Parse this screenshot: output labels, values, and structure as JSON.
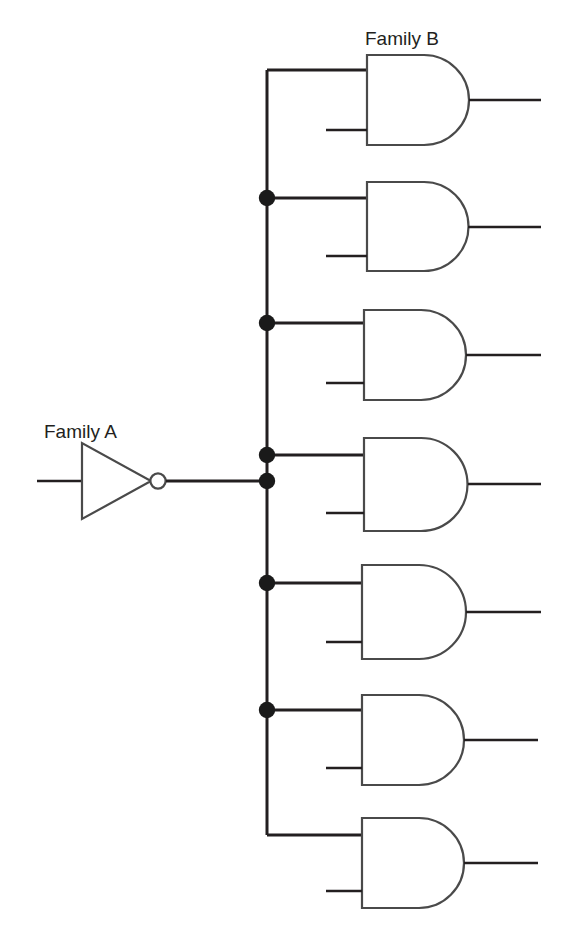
{
  "diagram": {
    "type": "digital-logic-schematic",
    "canvas": {
      "width": 569,
      "height": 935
    },
    "colors": {
      "background": "#ffffff",
      "wire": "#231f20",
      "gate_outline": "#4a4a4a",
      "junction_dot": "#1a1a1a",
      "label_text": "#231f20"
    },
    "labels": {
      "family_a": "Family A",
      "family_b": "Family B"
    },
    "label_positions": {
      "family_a": {
        "x": 44,
        "y": 438
      },
      "family_b": {
        "x": 365,
        "y": 45
      }
    },
    "driver": {
      "name": "inverter",
      "symbol": "NOT",
      "family": "Family A",
      "triangle": {
        "x1": 82,
        "y1": 443,
        "x2": 82,
        "y2": 519,
        "apex_x": 151,
        "apex_y": 481
      },
      "bubble": {
        "cx": 158,
        "cy": 481,
        "r": 8
      },
      "input_wire": {
        "x1": 37,
        "y1": 481,
        "x2": 82,
        "y2": 481
      },
      "output_wire": {
        "x1": 166,
        "y1": 481,
        "x2": 267,
        "y2": 481
      }
    },
    "bus": {
      "x": 267,
      "y_top": 70,
      "y_bottom": 835,
      "top_corner_to_gate_x": 367,
      "bottom_corner_to_gate_x": 362,
      "stroke_width": 3
    },
    "junction_dots": [
      {
        "y": 198,
        "r": 8
      },
      {
        "y": 323,
        "r": 8
      },
      {
        "y": 455,
        "r": 8
      },
      {
        "y": 481,
        "r": 8
      },
      {
        "y": 583,
        "r": 8
      },
      {
        "y": 710,
        "r": 8
      }
    ],
    "load_count": 7,
    "gates": [
      {
        "index": 1,
        "name": "and-gate-1",
        "symbol": "AND",
        "family": "Family B",
        "body": {
          "x": 367,
          "top": 55,
          "bottom": 145,
          "flat_right": 424,
          "arc_right": 478
        },
        "top_input": {
          "y": 70,
          "from_x": 267,
          "connector": "bus-top-corner",
          "has_dot": false
        },
        "bottom_input": {
          "y": 130,
          "from_x": 326
        },
        "output": {
          "y": 100,
          "to_x": 541
        }
      },
      {
        "index": 2,
        "name": "and-gate-2",
        "symbol": "AND",
        "family": "Family B",
        "body": {
          "x": 367,
          "top": 182,
          "bottom": 271,
          "flat_right": 424,
          "arc_right": 476
        },
        "top_input": {
          "y": 198,
          "from_x": 267,
          "connector": "bus-dot",
          "has_dot": true
        },
        "bottom_input": {
          "y": 256,
          "from_x": 326
        },
        "output": {
          "y": 227,
          "to_x": 541
        }
      },
      {
        "index": 3,
        "name": "and-gate-3",
        "symbol": "AND",
        "family": "Family B",
        "body": {
          "x": 364,
          "top": 310,
          "bottom": 400,
          "flat_right": 421,
          "arc_right": 473
        },
        "top_input": {
          "y": 323,
          "from_x": 267,
          "connector": "bus-dot",
          "has_dot": true
        },
        "bottom_input": {
          "y": 383,
          "from_x": 326
        },
        "output": {
          "y": 355,
          "to_x": 541
        }
      },
      {
        "index": 4,
        "name": "and-gate-4",
        "symbol": "AND",
        "family": "Family B",
        "body": {
          "x": 364,
          "top": 438,
          "bottom": 531,
          "flat_right": 421,
          "arc_right": 475
        },
        "top_input": {
          "y": 455,
          "from_x": 267,
          "connector": "bus-dot",
          "has_dot": true
        },
        "bottom_input": {
          "y": 513,
          "from_x": 326
        },
        "output": {
          "y": 484,
          "to_x": 541
        }
      },
      {
        "index": 5,
        "name": "and-gate-5",
        "symbol": "AND",
        "family": "Family B",
        "body": {
          "x": 362,
          "top": 565,
          "bottom": 659,
          "flat_right": 419,
          "arc_right": 472
        },
        "top_input": {
          "y": 583,
          "from_x": 267,
          "connector": "bus-dot",
          "has_dot": true
        },
        "bottom_input": {
          "y": 642,
          "from_x": 326
        },
        "output": {
          "y": 612,
          "to_x": 541
        }
      },
      {
        "index": 6,
        "name": "and-gate-6",
        "symbol": "AND",
        "family": "Family B",
        "body": {
          "x": 362,
          "top": 695,
          "bottom": 785,
          "flat_right": 419,
          "arc_right": 470
        },
        "top_input": {
          "y": 710,
          "from_x": 267,
          "connector": "bus-dot",
          "has_dot": true
        },
        "bottom_input": {
          "y": 768,
          "from_x": 326
        },
        "output": {
          "y": 740,
          "to_x": 538
        }
      },
      {
        "index": 7,
        "name": "and-gate-7",
        "symbol": "AND",
        "family": "Family B",
        "body": {
          "x": 362,
          "top": 818,
          "bottom": 908,
          "flat_right": 419,
          "arc_right": 470
        },
        "top_input": {
          "y": 835,
          "from_x": 267,
          "connector": "bus-bottom-corner",
          "has_dot": false
        },
        "bottom_input": {
          "y": 891,
          "from_x": 326
        },
        "output": {
          "y": 863,
          "to_x": 538
        }
      }
    ]
  }
}
